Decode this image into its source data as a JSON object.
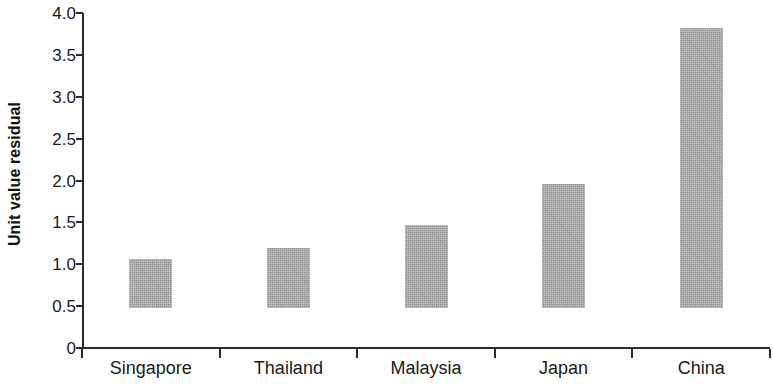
{
  "chart_data": {
    "type": "bar",
    "title": "",
    "subtitle": "",
    "xlabel": "",
    "ylabel": "Unit value residual",
    "categories": [
      "Singapore",
      "Thailand",
      "Malaysia",
      "Japan",
      "China"
    ],
    "values": [
      0.58,
      0.72,
      0.99,
      1.48,
      3.34
    ],
    "series": [
      {
        "name": "Unit value residual",
        "values": [
          0.58,
          0.72,
          0.99,
          1.48,
          3.34
        ]
      }
    ],
    "ylim": [
      0,
      4.0
    ],
    "y_ticks": [
      0,
      0.5,
      1.0,
      1.5,
      2.0,
      2.5,
      3.0,
      3.5,
      4.0
    ],
    "y_tick_labels": [
      "0",
      "0.5",
      "1.0",
      "1.5",
      "2.0",
      "2.5",
      "3.0",
      "3.5",
      "4.0"
    ],
    "grid": false,
    "legend": null,
    "legend_position": "none",
    "annotations": [],
    "bar_color": "#ababab",
    "axis_color": "#2b2b2b",
    "text_color": "#1a1a1a"
  }
}
